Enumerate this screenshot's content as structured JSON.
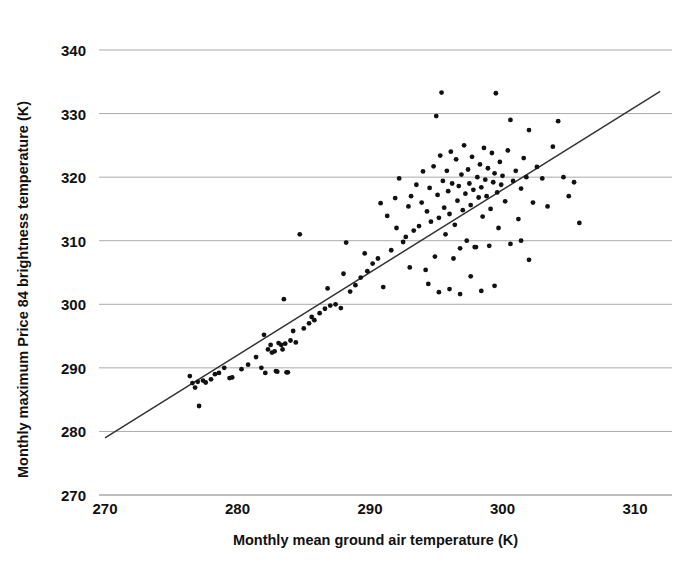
{
  "chart_data": {
    "type": "scatter",
    "title": "",
    "xlabel": "Monthly mean ground air temperature (K)",
    "ylabel": "Monthly maximum Price 84 brightness temperature (K)",
    "xlim": [
      270,
      313.4
    ],
    "ylim": [
      267.3,
      341.1
    ],
    "xticks": [
      270,
      280,
      290,
      300,
      310
    ],
    "yticks": [
      270,
      280,
      290,
      300,
      310,
      320,
      330,
      340
    ],
    "xtick_labels": [
      "270",
      "280",
      "290",
      "300",
      "310"
    ],
    "ytick_labels": [
      "270",
      "280",
      "290",
      "300",
      "310",
      "320",
      "330",
      "340"
    ],
    "grid": "horizontal",
    "grid_color": "#aaaaaa",
    "legend": "none",
    "marker_color": "#111111",
    "marker_size": 2.4,
    "trendline": {
      "label": "regression line",
      "color": "#333333",
      "x": [
        270.0,
        311.9
      ],
      "y": [
        279.0,
        333.5
      ]
    },
    "points": [
      [
        276.4,
        288.7
      ],
      [
        276.6,
        287.6
      ],
      [
        276.8,
        286.9
      ],
      [
        277.0,
        287.8
      ],
      [
        277.1,
        284.0
      ],
      [
        277.4,
        288.0
      ],
      [
        277.6,
        287.7
      ],
      [
        278.0,
        288.2
      ],
      [
        278.3,
        289.0
      ],
      [
        278.6,
        289.2
      ],
      [
        279.0,
        290.0
      ],
      [
        279.4,
        288.4
      ],
      [
        279.6,
        288.5
      ],
      [
        280.3,
        289.8
      ],
      [
        280.8,
        290.5
      ],
      [
        281.4,
        291.7
      ],
      [
        281.8,
        290.0
      ],
      [
        282.1,
        289.2
      ],
      [
        282.3,
        292.9
      ],
      [
        282.5,
        293.6
      ],
      [
        282.6,
        292.4
      ],
      [
        282.8,
        292.6
      ],
      [
        282.9,
        289.5
      ],
      [
        283.0,
        289.4
      ],
      [
        283.1,
        293.9
      ],
      [
        283.3,
        293.6
      ],
      [
        283.4,
        292.9
      ],
      [
        283.5,
        300.8
      ],
      [
        283.6,
        293.8
      ],
      [
        283.7,
        289.3
      ],
      [
        283.8,
        289.3
      ],
      [
        284.0,
        294.3
      ],
      [
        284.4,
        294.0
      ],
      [
        284.7,
        311.0
      ],
      [
        285.0,
        296.2
      ],
      [
        285.4,
        297.0
      ],
      [
        285.8,
        297.5
      ],
      [
        286.2,
        298.6
      ],
      [
        286.6,
        299.3
      ],
      [
        287.0,
        299.8
      ],
      [
        287.4,
        300.0
      ],
      [
        287.8,
        299.4
      ],
      [
        288.2,
        309.7
      ],
      [
        288.5,
        302.0
      ],
      [
        288.9,
        303.0
      ],
      [
        289.3,
        304.2
      ],
      [
        289.8,
        305.2
      ],
      [
        290.2,
        306.4
      ],
      [
        290.6,
        307.2
      ],
      [
        291.0,
        302.7
      ],
      [
        291.3,
        313.9
      ],
      [
        291.6,
        308.5
      ],
      [
        291.9,
        316.7
      ],
      [
        292.2,
        319.8
      ],
      [
        292.5,
        309.8
      ],
      [
        292.7,
        310.6
      ],
      [
        292.9,
        315.4
      ],
      [
        293.1,
        317.0
      ],
      [
        293.3,
        311.6
      ],
      [
        293.5,
        318.8
      ],
      [
        293.7,
        312.3
      ],
      [
        293.9,
        316.0
      ],
      [
        294.0,
        320.9
      ],
      [
        294.2,
        305.4
      ],
      [
        294.3,
        314.6
      ],
      [
        294.5,
        318.3
      ],
      [
        294.6,
        313.0
      ],
      [
        294.8,
        321.7
      ],
      [
        294.9,
        307.5
      ],
      [
        295.0,
        329.6
      ],
      [
        295.1,
        317.2
      ],
      [
        295.2,
        313.6
      ],
      [
        295.3,
        323.4
      ],
      [
        295.4,
        333.3
      ],
      [
        295.5,
        319.4
      ],
      [
        295.6,
        315.2
      ],
      [
        295.7,
        311.0
      ],
      [
        295.8,
        321.0
      ],
      [
        295.9,
        317.8
      ],
      [
        296.0,
        314.2
      ],
      [
        296.1,
        324.0
      ],
      [
        296.2,
        319.0
      ],
      [
        296.3,
        307.2
      ],
      [
        296.4,
        312.5
      ],
      [
        296.5,
        322.8
      ],
      [
        296.6,
        316.3
      ],
      [
        296.7,
        318.6
      ],
      [
        296.8,
        308.8
      ],
      [
        296.9,
        320.4
      ],
      [
        297.0,
        314.8
      ],
      [
        297.1,
        325.0
      ],
      [
        297.2,
        317.4
      ],
      [
        297.3,
        310.0
      ],
      [
        297.4,
        321.2
      ],
      [
        297.5,
        319.0
      ],
      [
        297.6,
        315.6
      ],
      [
        297.7,
        323.2
      ],
      [
        297.8,
        318.0
      ],
      [
        297.9,
        309.0
      ],
      [
        298.0,
        309.0
      ],
      [
        298.1,
        320.0
      ],
      [
        298.2,
        316.8
      ],
      [
        298.3,
        322.0
      ],
      [
        298.4,
        318.4
      ],
      [
        298.5,
        313.8
      ],
      [
        298.6,
        324.6
      ],
      [
        298.7,
        319.6
      ],
      [
        298.8,
        317.0
      ],
      [
        298.9,
        321.4
      ],
      [
        299.0,
        309.2
      ],
      [
        299.1,
        315.0
      ],
      [
        299.2,
        323.8
      ],
      [
        299.3,
        319.2
      ],
      [
        299.4,
        320.6
      ],
      [
        299.5,
        333.2
      ],
      [
        299.6,
        317.6
      ],
      [
        299.7,
        312.0
      ],
      [
        299.8,
        322.4
      ],
      [
        299.9,
        318.8
      ],
      [
        300.0,
        320.2
      ],
      [
        300.2,
        316.2
      ],
      [
        300.4,
        324.2
      ],
      [
        300.6,
        329.0
      ],
      [
        300.8,
        319.4
      ],
      [
        301.0,
        321.0
      ],
      [
        301.2,
        313.4
      ],
      [
        301.4,
        318.2
      ],
      [
        301.6,
        323.0
      ],
      [
        301.8,
        320.0
      ],
      [
        302.0,
        327.4
      ],
      [
        302.3,
        316.0
      ],
      [
        302.6,
        321.6
      ],
      [
        303.0,
        319.8
      ],
      [
        303.4,
        315.4
      ],
      [
        303.8,
        324.8
      ],
      [
        304.2,
        328.8
      ],
      [
        304.6,
        320.0
      ],
      [
        305.0,
        317.0
      ],
      [
        305.4,
        319.2
      ],
      [
        305.8,
        312.8
      ],
      [
        293.0,
        305.8
      ],
      [
        294.4,
        303.2
      ],
      [
        295.2,
        301.9
      ],
      [
        296.0,
        302.4
      ],
      [
        296.8,
        301.6
      ],
      [
        297.6,
        304.4
      ],
      [
        298.4,
        302.1
      ],
      [
        299.4,
        302.9
      ],
      [
        292.0,
        312.0
      ],
      [
        290.8,
        315.9
      ],
      [
        289.6,
        308.0
      ],
      [
        288.0,
        304.8
      ],
      [
        286.8,
        302.5
      ],
      [
        285.6,
        298.0
      ],
      [
        284.2,
        295.8
      ],
      [
        282.0,
        295.2
      ],
      [
        300.6,
        309.5
      ],
      [
        301.4,
        310.0
      ],
      [
        302.0,
        307.0
      ]
    ]
  }
}
